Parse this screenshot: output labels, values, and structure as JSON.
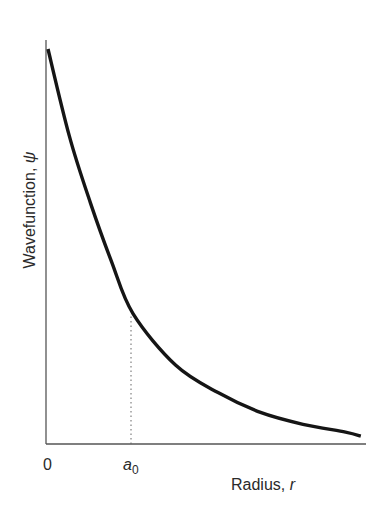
{
  "chart_data": {
    "type": "line",
    "title": "",
    "xlabel": "Radius, r",
    "ylabel": "Wavefunction, ψ",
    "xlabel_text": "Radius,",
    "xlabel_symbol": "r",
    "ylabel_text": "Wavefunction,",
    "ylabel_symbol": "ψ",
    "x_ticks": [
      "0",
      "a0"
    ],
    "x_tick_zero": "0",
    "x_tick_a_symbol": "a",
    "x_tick_a_subscript": "0",
    "grid": false,
    "legend": null,
    "x_units": "a0",
    "xlim": [
      0,
      3.68
    ],
    "ylim": [
      0,
      1
    ],
    "series": [
      {
        "name": "ψ(r)",
        "description": "Monotonically decaying curve, qualitatively consistent with ψ ∝ e^(-r/a0). The measured value at r = a0 (≈0.33) falls a bit below the e^-1 ≈ 0.37 an exact exponential would give, so the values below are read off the image rather than computed from the formula.",
        "x": [
          0,
          0.25,
          0.5,
          0.75,
          1.0,
          1.5,
          2.0,
          2.5,
          3.0,
          3.5,
          3.68
        ],
        "values": [
          1.0,
          0.78,
          0.61,
          0.46,
          0.33,
          0.2,
          0.13,
          0.08,
          0.05,
          0.03,
          0.02
        ]
      }
    ],
    "annotations": [
      {
        "type": "dotted-vertical-line",
        "x": 1.0,
        "label": "a0",
        "from_y": 0,
        "to_y": 0.33
      }
    ]
  }
}
